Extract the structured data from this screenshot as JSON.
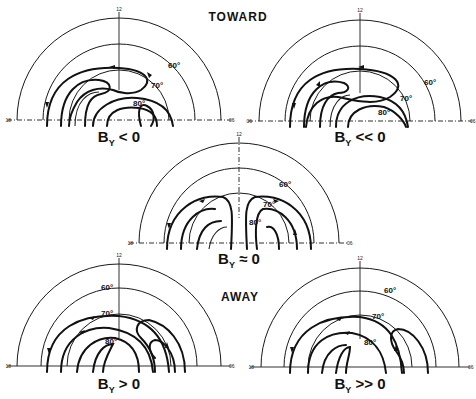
{
  "figure": {
    "group_labels": {
      "toward": "TOWARD",
      "away": "AWAY"
    },
    "colors": {
      "ink": "#111111",
      "background": "#ffffff"
    },
    "panels": [
      {
        "id": "by-lt-0",
        "caption_main": "B",
        "caption_sub": "Y",
        "caption_rel": " < 0",
        "group": "toward",
        "ticks": {
          "top": "12",
          "left": "18",
          "right": "06"
        },
        "latitudes": [
          "60°",
          "70°",
          "80°"
        ]
      },
      {
        "id": "by-ll-0",
        "caption_main": "B",
        "caption_sub": "Y",
        "caption_rel": " << 0",
        "group": "toward",
        "ticks": {
          "top": "12",
          "left": "18",
          "right": "06"
        },
        "latitudes": [
          "60°",
          "70°",
          "80°"
        ]
      },
      {
        "id": "by-approx-0",
        "caption_main": "B",
        "caption_sub": "Y",
        "caption_rel": " ≈ 0",
        "group": "neutral",
        "ticks": {
          "top": "12",
          "left": "18",
          "right": "06"
        },
        "latitudes": [
          "60°",
          "70°",
          "80°"
        ]
      },
      {
        "id": "by-gt-0",
        "caption_main": "B",
        "caption_sub": "Y",
        "caption_rel": " > 0",
        "group": "away",
        "ticks": {
          "top": "12",
          "left": "18",
          "right": "06"
        },
        "latitudes": [
          "60°",
          "70°",
          "80°"
        ]
      },
      {
        "id": "by-gg-0",
        "caption_main": "B",
        "caption_sub": "Y",
        "caption_rel": " >> 0",
        "group": "away",
        "ticks": {
          "top": "12",
          "left": "18",
          "right": "06"
        },
        "latitudes": [
          "60°",
          "70°",
          "80°"
        ]
      }
    ]
  }
}
